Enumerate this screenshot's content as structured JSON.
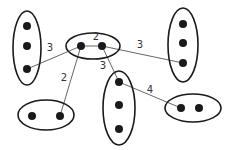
{
  "diagram": {
    "type": "clustered-graph",
    "colors": {
      "stroke": "#1a1a1a",
      "edge": "#555555",
      "label": "#333333",
      "background": "#ffffff"
    },
    "clusters": [
      {
        "id": "left",
        "cx": 27,
        "cy": 48,
        "rx": 14,
        "ry": 37,
        "nodes": [
          [
            27,
            26
          ],
          [
            27,
            46
          ],
          [
            27,
            69
          ]
        ]
      },
      {
        "id": "center",
        "cx": 93,
        "cy": 46,
        "rx": 27,
        "ry": 13,
        "nodes": [
          [
            81,
            46
          ],
          [
            102,
            46
          ]
        ]
      },
      {
        "id": "right",
        "cx": 183,
        "cy": 45,
        "rx": 15,
        "ry": 37,
        "nodes": [
          [
            183,
            24
          ],
          [
            183,
            43
          ],
          [
            183,
            63
          ]
        ]
      },
      {
        "id": "bottom-left",
        "cx": 46,
        "cy": 115,
        "rx": 28,
        "ry": 15,
        "nodes": [
          [
            32,
            116
          ],
          [
            60,
            116
          ]
        ]
      },
      {
        "id": "bottom-middle",
        "cx": 119,
        "cy": 108,
        "rx": 16,
        "ry": 37,
        "nodes": [
          [
            119,
            82
          ],
          [
            119,
            105
          ],
          [
            119,
            129
          ]
        ]
      },
      {
        "id": "bottom-right",
        "cx": 193,
        "cy": 108,
        "rx": 28,
        "ry": 14,
        "nodes": [
          [
            181,
            108
          ],
          [
            199,
            108
          ]
        ]
      }
    ],
    "edges": [
      {
        "from": [
          81,
          46
        ],
        "to": [
          102,
          46
        ],
        "weight": "2",
        "label_pos": [
          96,
          40
        ]
      },
      {
        "from": [
          27,
          69
        ],
        "to": [
          81,
          46
        ],
        "weight": "3",
        "label_pos": [
          50,
          51
        ]
      },
      {
        "from": [
          102,
          46
        ],
        "to": [
          183,
          63
        ],
        "weight": "3",
        "label_pos": [
          140,
          48
        ]
      },
      {
        "from": [
          81,
          46
        ],
        "to": [
          60,
          116
        ],
        "weight": "2",
        "label_pos": [
          64,
          81
        ]
      },
      {
        "from": [
          102,
          46
        ],
        "to": [
          119,
          82
        ],
        "weight": "3",
        "label_pos": [
          103,
          69
        ]
      },
      {
        "from": [
          119,
          82
        ],
        "to": [
          181,
          108
        ],
        "weight": "4",
        "label_pos": [
          150,
          93
        ]
      }
    ]
  }
}
